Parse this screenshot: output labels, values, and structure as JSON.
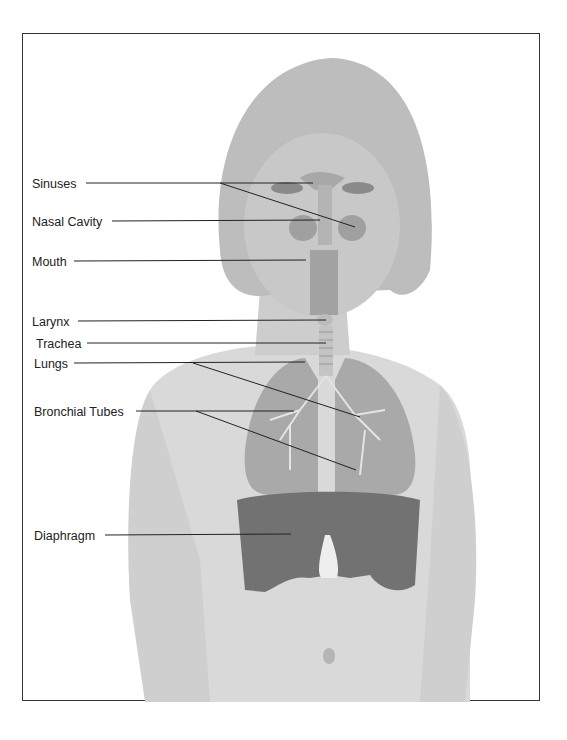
{
  "figure": {
    "labels": [
      {
        "id": "sinuses",
        "text": "Sinuses",
        "x": 32,
        "y": 177,
        "line_start": [
          86,
          183
        ],
        "targets": [
          [
            313,
            183
          ],
          [
            355,
            227
          ]
        ]
      },
      {
        "id": "nasal-cavity",
        "text": "Nasal Cavity",
        "x": 32,
        "y": 215,
        "line_start": [
          112,
          221
        ],
        "targets": [
          [
            320,
            220
          ]
        ]
      },
      {
        "id": "mouth",
        "text": "Mouth",
        "x": 32,
        "y": 255,
        "line_start": [
          74,
          261
        ],
        "targets": [
          [
            306,
            260
          ]
        ]
      },
      {
        "id": "larynx",
        "text": "Larynx",
        "x": 32,
        "y": 316,
        "line_start": [
          78,
          321
        ],
        "targets": [
          [
            326,
            320
          ]
        ]
      },
      {
        "id": "trachea",
        "text": "Trachea",
        "x": 36,
        "y": 338,
        "line_start": [
          87,
          343
        ],
        "targets": [
          [
            326,
            343
          ]
        ]
      },
      {
        "id": "lungs",
        "text": "Lungs",
        "x": 34,
        "y": 358,
        "line_start": [
          74,
          363
        ],
        "targets": [
          [
            305,
            362
          ],
          [
            360,
            417
          ]
        ]
      },
      {
        "id": "bronchial-tubes",
        "text": "Bronchial Tubes",
        "x": 34,
        "y": 406,
        "line_start": [
          136,
          411
        ],
        "targets": [
          [
            294,
            411
          ],
          [
            356,
            470
          ]
        ]
      },
      {
        "id": "diaphragm",
        "text": "Diaphragm",
        "x": 34,
        "y": 530,
        "line_start": [
          105,
          535
        ],
        "targets": [
          [
            291,
            534
          ]
        ]
      }
    ],
    "colors": {
      "frame": "#333333",
      "line": "#222222",
      "organ": "#9a9a9a",
      "diaphragm": "#6e6e6e",
      "skin": "#dcdcdc"
    }
  }
}
